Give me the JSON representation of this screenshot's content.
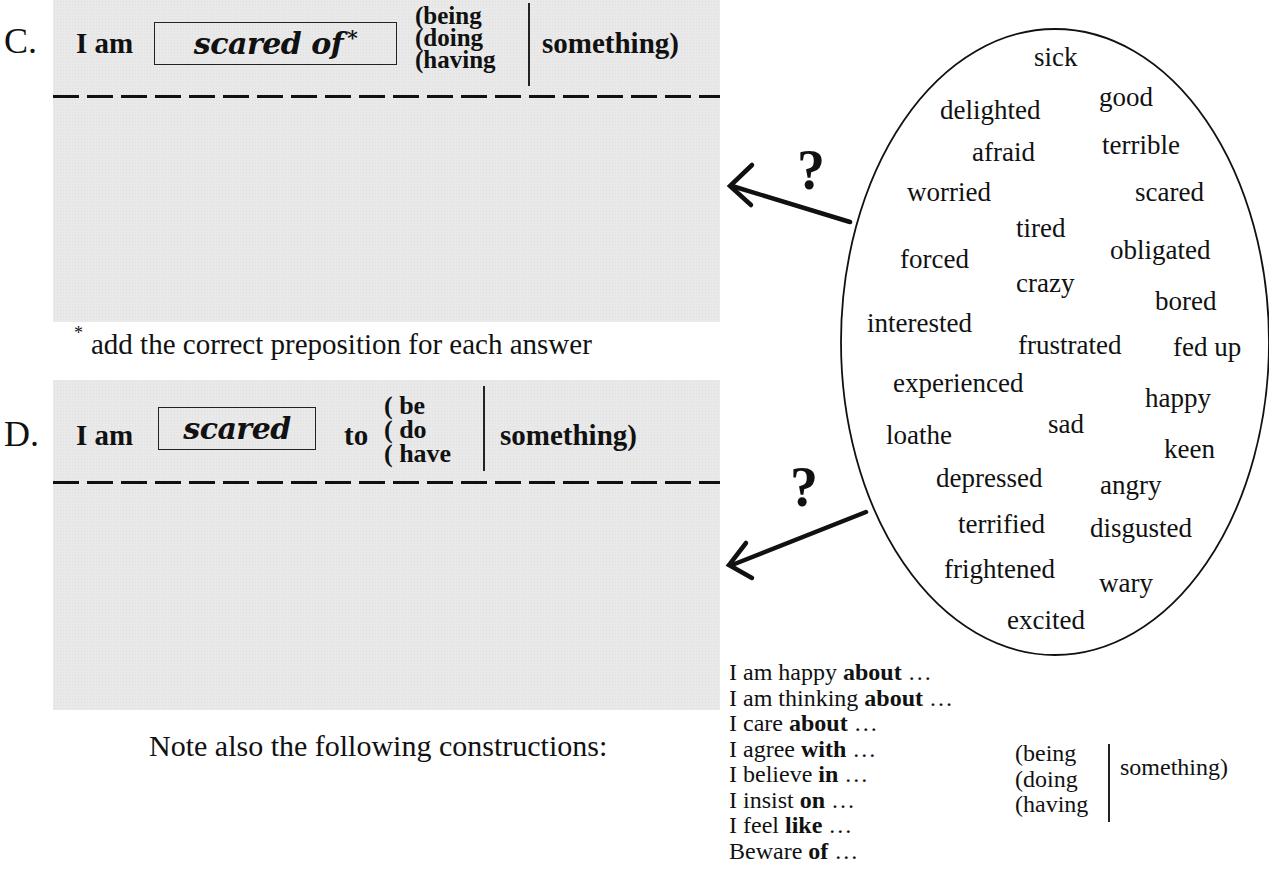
{
  "section_c": {
    "letter": "C.",
    "subject": "I am",
    "answer": "scared of",
    "answer_mark": "*",
    "options": [
      "(being",
      "(doing",
      "(having"
    ],
    "object": "something)"
  },
  "footnote": {
    "mark": "*",
    "text": "add the correct preposition for each answer"
  },
  "section_d": {
    "letter": "D.",
    "subject": "I am",
    "answer": "scared",
    "connector": "to",
    "options": [
      "( be",
      "( do",
      "( have"
    ],
    "object": "something)"
  },
  "note": "Note also the following constructions:",
  "word_bubble": {
    "question_marks": [
      "?",
      "?"
    ],
    "words": [
      {
        "text": "sick",
        "x": 1034,
        "y": 42
      },
      {
        "text": "good",
        "x": 1099,
        "y": 82
      },
      {
        "text": "delighted",
        "x": 940,
        "y": 95
      },
      {
        "text": "afraid",
        "x": 972,
        "y": 137
      },
      {
        "text": "terrible",
        "x": 1102,
        "y": 130
      },
      {
        "text": "worried",
        "x": 907,
        "y": 177
      },
      {
        "text": "scared",
        "x": 1135,
        "y": 177
      },
      {
        "text": "tired",
        "x": 1016,
        "y": 213
      },
      {
        "text": "obligated",
        "x": 1110,
        "y": 235
      },
      {
        "text": "forced",
        "x": 900,
        "y": 244
      },
      {
        "text": "crazy",
        "x": 1016,
        "y": 268
      },
      {
        "text": "bored",
        "x": 1155,
        "y": 286
      },
      {
        "text": "interested",
        "x": 867,
        "y": 308
      },
      {
        "text": "frustrated",
        "x": 1018,
        "y": 330
      },
      {
        "text": "fed up",
        "x": 1173,
        "y": 332
      },
      {
        "text": "experienced",
        "x": 893,
        "y": 368
      },
      {
        "text": "happy",
        "x": 1145,
        "y": 383
      },
      {
        "text": "sad",
        "x": 1048,
        "y": 409
      },
      {
        "text": "loathe",
        "x": 886,
        "y": 420
      },
      {
        "text": "keen",
        "x": 1164,
        "y": 434
      },
      {
        "text": "depressed",
        "x": 936,
        "y": 463
      },
      {
        "text": "angry",
        "x": 1100,
        "y": 470
      },
      {
        "text": "terrified",
        "x": 958,
        "y": 509
      },
      {
        "text": "disgusted",
        "x": 1090,
        "y": 513
      },
      {
        "text": "frightened",
        "x": 944,
        "y": 554
      },
      {
        "text": "wary",
        "x": 1099,
        "y": 568
      },
      {
        "text": "excited",
        "x": 1007,
        "y": 605
      }
    ]
  },
  "constructions": {
    "lines": [
      {
        "pre": "I am happy ",
        "prep": "about",
        "post": " …"
      },
      {
        "pre": "I am thinking ",
        "prep": "about",
        "post": " …"
      },
      {
        "pre": "I care ",
        "prep": "about",
        "post": " …"
      },
      {
        "pre": "I agree ",
        "prep": "with",
        "post": " …"
      },
      {
        "pre": "I believe ",
        "prep": "in",
        "post": " …"
      },
      {
        "pre": "I insist ",
        "prep": "on",
        "post": " …"
      },
      {
        "pre": "I feel ",
        "prep": "like",
        "post": " …"
      },
      {
        "pre": "Beware ",
        "prep": "of",
        "post": " …"
      }
    ],
    "options": [
      "(being",
      "(doing",
      "(having"
    ],
    "object": "something)"
  }
}
